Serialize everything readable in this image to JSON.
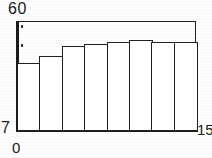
{
  "chart_data": {
    "type": "bar",
    "title": "",
    "subtitle": "",
    "xlabel": "",
    "ylabel": "",
    "categories": [
      "1",
      "2",
      "3",
      "4",
      "5",
      "6",
      "7",
      "8"
    ],
    "values": [
      40,
      43,
      48,
      49,
      50,
      51,
      50,
      50
    ],
    "xlim": [
      0,
      15
    ],
    "ylim": [
      7,
      60
    ],
    "x_tick_labels": [
      "0",
      "15"
    ],
    "y_tick_labels": [
      "7",
      "60"
    ],
    "grid": false,
    "legend": null,
    "legend_position": "none",
    "bar_fill_color": "#ffffff",
    "bar_edge_color": "#1f1f1f",
    "axis_color": "#1c1c1c",
    "background_color": "#ffffff",
    "annotations": [
      {
        "name": "y-tick-dot-upper",
        "x_frac": 0.022,
        "y_frac": 0.04
      },
      {
        "name": "y-tick-dot-lower",
        "x_frac": 0.022,
        "y_frac": 0.21
      }
    ]
  },
  "axes": {
    "y_max_label": "60",
    "y_min_label": "7",
    "x_min_label": "0",
    "x_max_label": "15"
  }
}
